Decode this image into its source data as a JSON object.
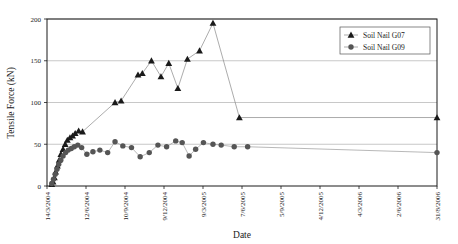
{
  "chart_data": {
    "type": "line",
    "title": "",
    "xlabel": "Date",
    "ylabel": "Tensile Force (kN)",
    "ylim": [
      0,
      200
    ],
    "yticks": [
      0,
      50,
      100,
      150,
      200
    ],
    "ytick_labels": [
      "0",
      "50",
      "100",
      "150",
      "200"
    ],
    "grid": true,
    "grid_axis": "y",
    "legend_position": "top-right",
    "x_axis_type": "date",
    "xlim": [
      "14/3/2004",
      "31/8/2006"
    ],
    "xticks": [
      "14/3/2004",
      "12/6/2004",
      "10/9/2004",
      "9/12/2004",
      "9/3/2005",
      "7/6/2005",
      "5/9/2005",
      "4/12/2005",
      "4/3/2006",
      "2/6/2006",
      "31/8/2006"
    ],
    "xtick_labels_rotated": true,
    "series": [
      {
        "name": "Soil Nail G07",
        "marker": "triangle",
        "color": "#1a1a1a",
        "line_color": "#888888",
        "points": [
          {
            "x": "25/3/2004",
            "y": 2
          },
          {
            "x": "28/3/2004",
            "y": 5
          },
          {
            "x": "31/3/2004",
            "y": 10
          },
          {
            "x": "3/4/2004",
            "y": 17
          },
          {
            "x": "7/4/2004",
            "y": 24
          },
          {
            "x": "11/4/2004",
            "y": 31
          },
          {
            "x": "15/4/2004",
            "y": 38
          },
          {
            "x": "20/4/2004",
            "y": 44
          },
          {
            "x": "25/4/2004",
            "y": 50
          },
          {
            "x": "30/4/2004",
            "y": 55
          },
          {
            "x": "6/5/2004",
            "y": 58
          },
          {
            "x": "12/5/2004",
            "y": 60
          },
          {
            "x": "18/5/2004",
            "y": 63
          },
          {
            "x": "26/5/2004",
            "y": 66
          },
          {
            "x": "4/6/2004",
            "y": 65
          },
          {
            "x": "18/8/2004",
            "y": 100
          },
          {
            "x": "1/9/2004",
            "y": 102
          },
          {
            "x": "10/10/2004",
            "y": 133
          },
          {
            "x": "20/10/2004",
            "y": 135
          },
          {
            "x": "10/11/2004",
            "y": 150
          },
          {
            "x": "2/12/2004",
            "y": 131
          },
          {
            "x": "20/12/2004",
            "y": 147
          },
          {
            "x": "10/1/2005",
            "y": 117
          },
          {
            "x": "1/2/2005",
            "y": 152
          },
          {
            "x": "1/3/2005",
            "y": 162
          },
          {
            "x": "1/4/2005",
            "y": 195
          },
          {
            "x": "1/6/2005",
            "y": 82
          },
          {
            "x": "31/8/2006",
            "y": 82
          }
        ]
      },
      {
        "name": "Soil Nail G09",
        "marker": "circle",
        "color": "#555555",
        "line_color": "#999999",
        "points": [
          {
            "x": "25/3/2004",
            "y": 3
          },
          {
            "x": "29/3/2004",
            "y": 8
          },
          {
            "x": "2/4/2004",
            "y": 14
          },
          {
            "x": "6/4/2004",
            "y": 20
          },
          {
            "x": "10/4/2004",
            "y": 26
          },
          {
            "x": "15/4/2004",
            "y": 31
          },
          {
            "x": "20/4/2004",
            "y": 36
          },
          {
            "x": "26/4/2004",
            "y": 40
          },
          {
            "x": "2/5/2004",
            "y": 43
          },
          {
            "x": "9/5/2004",
            "y": 45
          },
          {
            "x": "16/5/2004",
            "y": 47
          },
          {
            "x": "24/5/2004",
            "y": 49
          },
          {
            "x": "2/6/2004",
            "y": 46
          },
          {
            "x": "14/6/2004",
            "y": 38
          },
          {
            "x": "28/6/2004",
            "y": 41
          },
          {
            "x": "14/7/2004",
            "y": 43
          },
          {
            "x": "1/8/2004",
            "y": 40
          },
          {
            "x": "18/8/2004",
            "y": 53
          },
          {
            "x": "5/9/2004",
            "y": 48
          },
          {
            "x": "25/9/2004",
            "y": 46
          },
          {
            "x": "15/10/2004",
            "y": 35
          },
          {
            "x": "5/11/2004",
            "y": 40
          },
          {
            "x": "25/11/2004",
            "y": 49
          },
          {
            "x": "15/12/2004",
            "y": 47
          },
          {
            "x": "5/1/2005",
            "y": 54
          },
          {
            "x": "20/1/2005",
            "y": 52
          },
          {
            "x": "5/2/2005",
            "y": 36
          },
          {
            "x": "20/2/2005",
            "y": 44
          },
          {
            "x": "10/3/2005",
            "y": 52
          },
          {
            "x": "1/4/2005",
            "y": 50
          },
          {
            "x": "20/4/2005",
            "y": 49
          },
          {
            "x": "20/5/2005",
            "y": 47
          },
          {
            "x": "20/6/2005",
            "y": 47
          },
          {
            "x": "31/8/2006",
            "y": 40
          }
        ]
      }
    ],
    "legend": [
      {
        "label": "Soil Nail G07",
        "marker": "triangle"
      },
      {
        "label": "Soil Nail G09",
        "marker": "circle"
      }
    ]
  }
}
